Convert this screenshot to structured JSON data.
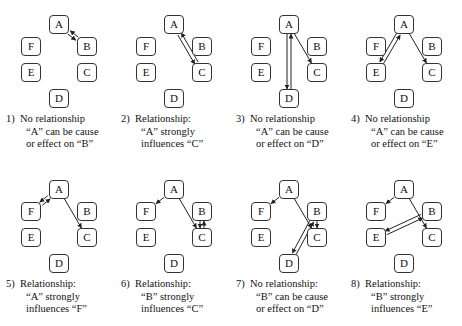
{
  "panels": [
    {
      "id": 1,
      "number": "1)",
      "lines": [
        "No relationship",
        "“A” can be cause",
        "or effect on “B”"
      ],
      "edges": [
        [
          "A",
          "B",
          "pair"
        ]
      ]
    },
    {
      "id": 2,
      "number": "2)",
      "lines": [
        "Relationship:",
        "“A” strongly",
        "influences “C”"
      ],
      "edges": [
        [
          "A",
          "C",
          "pair"
        ]
      ]
    },
    {
      "id": 3,
      "number": "3)",
      "lines": [
        "No relationship",
        "“A” can be cause",
        "or effect on “D”"
      ],
      "edges": [
        [
          "A",
          "C",
          "single"
        ],
        [
          "A",
          "D",
          "pair"
        ]
      ]
    },
    {
      "id": 4,
      "number": "4)",
      "lines": [
        "No relationship",
        "“A” can be cause",
        "or effect on “E”"
      ],
      "edges": [
        [
          "A",
          "C",
          "single"
        ],
        [
          "A",
          "E",
          "pair"
        ]
      ]
    },
    {
      "id": 5,
      "number": "5)",
      "lines": [
        "Relationship:",
        "“A” strongly",
        "influences “F”"
      ],
      "edges": [
        [
          "A",
          "C",
          "single"
        ],
        [
          "A",
          "F",
          "pair"
        ]
      ]
    },
    {
      "id": 6,
      "number": "6)",
      "lines": [
        "Relationship:",
        "“B” strongly",
        "influences “C”"
      ],
      "edges": [
        [
          "A",
          "F",
          "single"
        ],
        [
          "A",
          "C",
          "single"
        ],
        [
          "B",
          "C",
          "pair"
        ]
      ]
    },
    {
      "id": 7,
      "number": "7)",
      "lines": [
        "No relationship:",
        "“B” can be cause",
        "or effect on “D”"
      ],
      "edges": [
        [
          "A",
          "F",
          "single"
        ],
        [
          "A",
          "C",
          "single"
        ],
        [
          "B",
          "C",
          "single"
        ],
        [
          "B",
          "D",
          "pair"
        ]
      ]
    },
    {
      "id": 8,
      "number": "8)",
      "lines": [
        "Relationship:",
        "“B” strongly",
        "influences “E”"
      ],
      "edges": [
        [
          "A",
          "F",
          "single"
        ],
        [
          "A",
          "C",
          "single"
        ],
        [
          "B",
          "E",
          "pair"
        ]
      ]
    }
  ],
  "node_labels": {
    "A": "A",
    "B": "B",
    "C": "C",
    "D": "D",
    "E": "E",
    "F": "F"
  },
  "colors": {
    "line": "#222222",
    "node_border": "#333333"
  }
}
